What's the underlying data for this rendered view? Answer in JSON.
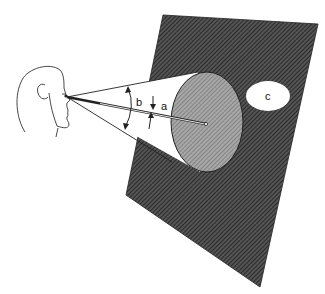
{
  "figure": {
    "labels": {
      "a": "a",
      "b": "b",
      "c": "c"
    },
    "colors": {
      "board": "#3a3a3a",
      "disc": "#8a8a8a",
      "cone": "#ffffff",
      "oval": "#ffffff",
      "line": "#222222"
    }
  }
}
